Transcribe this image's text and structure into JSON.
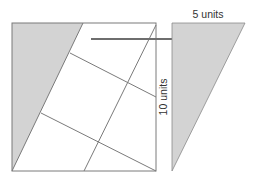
{
  "diagram": {
    "labels": {
      "top": "5 units",
      "side": "10 units"
    },
    "colors": {
      "shade": "#d3d3d3",
      "line": "#7a7a7a",
      "arrow": "#6e6e6e",
      "text": "#333333"
    },
    "shapes": {
      "square": {
        "x": 12,
        "y": 23,
        "w": 144,
        "h": 148
      },
      "left_triangle": [
        [
          12,
          23
        ],
        [
          83,
          23
        ],
        [
          12,
          171
        ]
      ],
      "right_triangle": [
        [
          172,
          23
        ],
        [
          245,
          23
        ],
        [
          172,
          171
        ]
      ],
      "arrow": {
        "x1": 91,
        "y1": 39,
        "x2": 192,
        "y2": 39
      }
    }
  }
}
